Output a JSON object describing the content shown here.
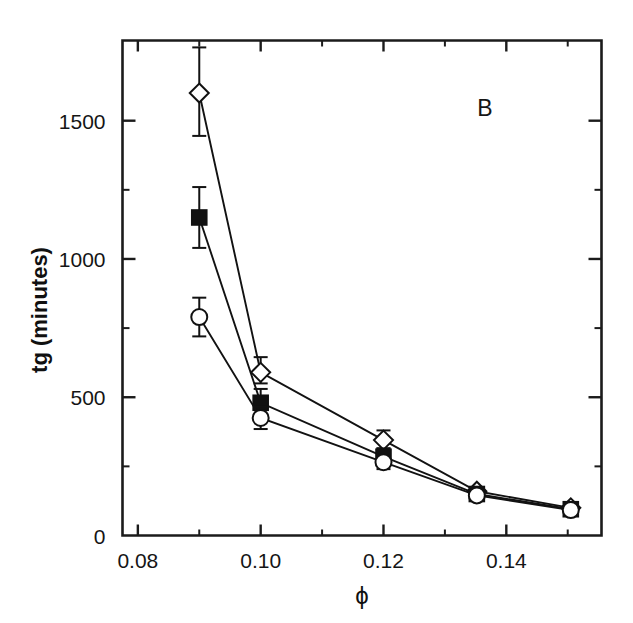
{
  "figure": {
    "panel_label": "B",
    "background_color": "#ffffff",
    "ink_color": "#121212"
  },
  "chart_data": {
    "type": "line",
    "title": "",
    "subtitle": "",
    "panel": "B",
    "xlabel": "ϕ",
    "ylabel": "tg (minutes)",
    "xlim": [
      0.0775,
      0.1555
    ],
    "ylim": [
      0,
      1790
    ],
    "grid": false,
    "legend": "none",
    "x_major_ticks": [
      0.08,
      0.1,
      0.12,
      0.14
    ],
    "x_major_tick_labels": [
      "0.08",
      "0.10",
      "0.12",
      "0.14"
    ],
    "x_minor_ticks": [
      0.09,
      0.11,
      0.13,
      0.15
    ],
    "y_major_ticks": [
      0,
      500,
      1000,
      1500
    ],
    "y_major_tick_labels": [
      "0",
      "500",
      "1000",
      "1500"
    ],
    "y_minor_ticks": [
      250,
      750,
      1250
    ],
    "series": [
      {
        "name": "open-diamond",
        "marker": "diamond-open",
        "x": [
          0.09,
          0.1,
          0.12,
          0.1352,
          0.1505
        ],
        "values": [
          1600,
          590,
          345,
          160,
          100
        ],
        "yerr_low": [
          155,
          40,
          30,
          15,
          10
        ],
        "yerr_high": [
          165,
          55,
          35,
          15,
          10
        ]
      },
      {
        "name": "filled-square",
        "marker": "square-filled",
        "x": [
          0.09,
          0.1,
          0.12,
          0.1352,
          0.1505
        ],
        "values": [
          1150,
          480,
          285,
          150,
          95
        ],
        "yerr_low": [
          110,
          50,
          30,
          12,
          8
        ],
        "yerr_high": [
          110,
          50,
          30,
          12,
          8
        ]
      },
      {
        "name": "open-circle",
        "marker": "circle-open",
        "x": [
          0.09,
          0.1,
          0.12,
          0.1352,
          0.1505
        ],
        "values": [
          790,
          425,
          265,
          145,
          92
        ],
        "yerr_low": [
          70,
          40,
          25,
          10,
          8
        ],
        "yerr_high": [
          70,
          40,
          25,
          10,
          8
        ]
      }
    ]
  }
}
